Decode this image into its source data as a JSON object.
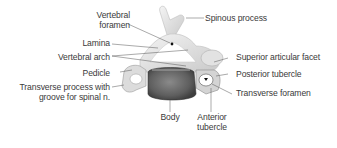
{
  "figure": {
    "labels": {
      "vertebral_foramen_1": "Vertebral",
      "vertebral_foramen_2": "foramen",
      "lamina": "Lamina",
      "vertebral_arch": "Vertebral arch",
      "pedicle": "Pedicle",
      "transverse_process_1": "Transverse process with",
      "transverse_process_2": "groove for spinal n.",
      "body": "Body",
      "anterior_tubercle_1": "Anterior",
      "anterior_tubercle_2": "tubercle",
      "spinous_process": "Spinous process",
      "superior_articular_facet": "Superior articular facet",
      "posterior_tubercle": "Posterior tubercle",
      "transverse_foramen": "Transverse foramen"
    },
    "colors": {
      "text": "#3a3a3a",
      "leader": "#555555",
      "bone_light": "#ececec",
      "bone_mid": "#c8c8c8",
      "bone_dark": "#6e6e6e",
      "background": "#ffffff"
    }
  }
}
